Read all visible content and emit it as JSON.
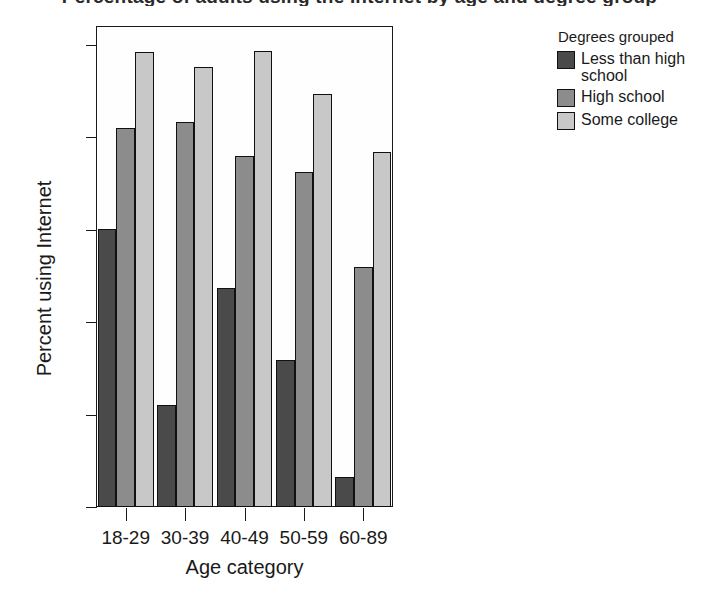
{
  "figure": {
    "title": "Percentage of adults using the Internet by age and degree group",
    "background": "#ffffff"
  },
  "axes": {
    "y": {
      "label": "Percent using Internet",
      "ticks": [
        "0",
        "20",
        "40",
        "60",
        "80",
        "100"
      ],
      "min": 0,
      "max": 100
    },
    "x": {
      "label": "Age category",
      "ticks": [
        "18-29",
        "30-39",
        "40-49",
        "50-59",
        "60-89"
      ]
    }
  },
  "legend": {
    "title": "Degrees grouped",
    "entries": [
      {
        "label": "Less than high school",
        "color": "#4a4a4a"
      },
      {
        "label": "High school",
        "color": "#8c8c8c"
      },
      {
        "label": "Some college",
        "color": "#c8c8c8"
      }
    ]
  },
  "chart_data": {
    "type": "bar",
    "title": "Percentage of adults using the Internet by age and degree group",
    "xlabel": "Age category",
    "ylabel": "Percent using Internet",
    "ylim": [
      0,
      100
    ],
    "yticks": [
      0,
      20,
      40,
      60,
      80,
      100
    ],
    "grid": false,
    "legend_title": "Degrees grouped",
    "legend_position": "right",
    "categories": [
      "18-29",
      "30-39",
      "40-49",
      "50-59",
      "60-89"
    ],
    "series": [
      {
        "name": "Less than high school",
        "color": "#4a4a4a",
        "values": [
          60.2,
          22.1,
          47.4,
          31.8,
          6.5
        ]
      },
      {
        "name": "High school",
        "color": "#8c8c8c",
        "values": [
          82.0,
          83.3,
          76.0,
          72.5,
          51.9
        ]
      },
      {
        "name": "Some college",
        "color": "#c8c8c8",
        "values": [
          98.4,
          95.2,
          98.8,
          89.5,
          76.8
        ]
      }
    ]
  }
}
